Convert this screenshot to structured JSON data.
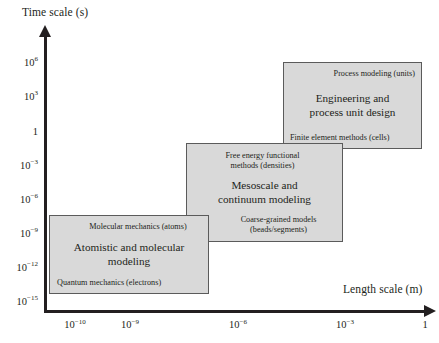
{
  "chart_data": {
    "type": "diagram",
    "title": "",
    "xlabel": "Length scale (m)",
    "ylabel": "Time scale (s)",
    "x_ticks": [
      {
        "label": "10−10",
        "mantissa": "10",
        "exponent": "−10",
        "x_px": 75
      },
      {
        "label": "10−9",
        "mantissa": "10",
        "exponent": "−9",
        "x_px": 130
      },
      {
        "label": "10−6",
        "mantissa": "10",
        "exponent": "−6",
        "x_px": 238
      },
      {
        "label": "10−3",
        "mantissa": "10",
        "exponent": "−3",
        "x_px": 345
      },
      {
        "label": "1",
        "mantissa": "1",
        "exponent": "",
        "x_px": 425
      }
    ],
    "y_ticks": [
      {
        "mantissa": "10",
        "exponent": "6",
        "y_px": 63
      },
      {
        "mantissa": "10",
        "exponent": "3",
        "y_px": 97
      },
      {
        "mantissa": "1",
        "exponent": "",
        "y_px": 132
      },
      {
        "mantissa": "10",
        "exponent": "−3",
        "y_px": 166
      },
      {
        "mantissa": "10",
        "exponent": "−6",
        "y_px": 200
      },
      {
        "mantissa": "10",
        "exponent": "−9",
        "y_px": 234
      },
      {
        "mantissa": "10",
        "exponent": "−12",
        "y_px": 268
      },
      {
        "mantissa": "10",
        "exponent": "−15",
        "y_px": 302
      }
    ],
    "grid": false,
    "legend": "none",
    "boxes": [
      {
        "id": "atomistic",
        "top_label": "Molecular mechanics (atoms)",
        "main_label": "Atomistic and molecular\nmodeling",
        "bottom_label": "Quantum mechanics (electrons)",
        "x_range": [
          "10−10",
          "10−7"
        ],
        "y_range": [
          "10−15",
          "10−8"
        ]
      },
      {
        "id": "mesoscale",
        "top_label": "Free energy functional\nmethods (densities)",
        "main_label": "Mesoscale and\ncontinuum modeling",
        "bottom_label": "Coarse-grained models\n(beads/segments)",
        "x_range": [
          "10−7",
          "10−4"
        ],
        "y_range": [
          "10−9",
          "10−2"
        ]
      },
      {
        "id": "engineering",
        "top_label": "Process modeling (units)",
        "main_label": "Engineering and\nprocess unit design",
        "bottom_label": "Finite element methods (cells)",
        "x_range": [
          "10−4",
          "1"
        ],
        "y_range": [
          "10−3",
          "10⁶6"
        ]
      }
    ]
  },
  "colors": {
    "box_fill": "#d9d9d9",
    "box_border": "#5b5b5b",
    "axis": "#231f20",
    "background": "#ffffff",
    "text": "#231f20"
  }
}
